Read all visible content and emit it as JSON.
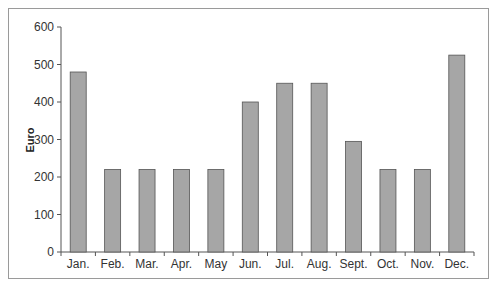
{
  "chart_data": {
    "type": "bar",
    "title": "",
    "xlabel": "",
    "ylabel": "Euro",
    "ylim": [
      0,
      600
    ],
    "yticks": [
      0,
      100,
      200,
      300,
      400,
      500,
      600
    ],
    "grid": false,
    "legend": null,
    "categories": [
      "Jan.",
      "Feb.",
      "Mar.",
      "Apr.",
      "May",
      "Jun.",
      "Jul.",
      "Aug.",
      "Sept.",
      "Oct.",
      "Nov.",
      "Dec."
    ],
    "values": [
      480,
      220,
      220,
      220,
      220,
      400,
      450,
      450,
      295,
      220,
      220,
      525
    ],
    "colors": {
      "bar": "#a6a6a6",
      "bar_edge": "#555555",
      "axis": "#555555",
      "frame": "#9a9a9a"
    }
  }
}
